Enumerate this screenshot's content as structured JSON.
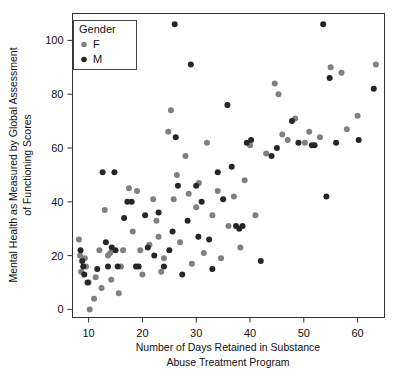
{
  "chart_data": {
    "type": "scatter",
    "title": "",
    "xlabel": "Number of Days Retained in Substance Abuse Treatment Program",
    "xlabel_line1": "Number of Days Retained in Substance",
    "xlabel_line2": "Abuse Treatment Program",
    "ylabel": "Mental Health as Measured by Global Assessment of Functioning Scores",
    "ylabel_line1": "Mental Health as Measured by Global Assessment",
    "ylabel_line2": "of Functioning Scores",
    "xlim": [
      7,
      65
    ],
    "ylim": [
      -3,
      110
    ],
    "xticks": [
      10,
      20,
      30,
      40,
      50,
      60
    ],
    "yticks": [
      0,
      20,
      40,
      60,
      80,
      100
    ],
    "xtick_labels": [
      "10",
      "20",
      "30",
      "40",
      "50",
      "60"
    ],
    "ytick_labels": [
      "0",
      "20",
      "40",
      "60",
      "80",
      "100"
    ],
    "grid": false,
    "legend": {
      "title": "Gender",
      "position": "top-left-inside",
      "entries": [
        {
          "name": "F",
          "label": "F",
          "color": "#808080"
        },
        {
          "name": "M",
          "label": "M",
          "color": "#262626"
        }
      ]
    },
    "marker": {
      "shape": "circle",
      "radius": 3.0
    },
    "series": [
      {
        "name": "F",
        "label": "F",
        "color": "#808080",
        "points": [
          [
            8.2,
            26
          ],
          [
            8.4,
            20
          ],
          [
            8.6,
            14
          ],
          [
            9.3,
            19
          ],
          [
            9.5,
            16
          ],
          [
            10.0,
            10
          ],
          [
            10.2,
            0
          ],
          [
            11.0,
            4
          ],
          [
            11.3,
            12
          ],
          [
            12.0,
            22
          ],
          [
            12.4,
            8
          ],
          [
            13.0,
            37
          ],
          [
            13.6,
            20
          ],
          [
            14.0,
            21
          ],
          [
            14.2,
            11
          ],
          [
            15.6,
            6
          ],
          [
            16.0,
            16
          ],
          [
            16.4,
            22
          ],
          [
            17.5,
            45
          ],
          [
            18.2,
            29
          ],
          [
            19.0,
            44
          ],
          [
            19.6,
            22
          ],
          [
            20.0,
            13
          ],
          [
            21.3,
            24
          ],
          [
            22.0,
            41
          ],
          [
            22.6,
            33
          ],
          [
            23.0,
            27
          ],
          [
            23.5,
            14
          ],
          [
            24.0,
            19
          ],
          [
            24.8,
            66
          ],
          [
            25.3,
            74
          ],
          [
            25.8,
            41
          ],
          [
            26.4,
            50
          ],
          [
            27.0,
            25
          ],
          [
            28.0,
            57
          ],
          [
            28.6,
            43
          ],
          [
            29.2,
            17
          ],
          [
            30.0,
            38
          ],
          [
            30.5,
            47
          ],
          [
            31.4,
            21
          ],
          [
            32.0,
            62
          ],
          [
            33.0,
            35
          ],
          [
            34.0,
            44
          ],
          [
            34.6,
            19
          ],
          [
            36.0,
            31
          ],
          [
            37.0,
            42
          ],
          [
            38.2,
            23
          ],
          [
            39.0,
            48
          ],
          [
            40.0,
            61
          ],
          [
            41.0,
            35
          ],
          [
            43.0,
            58
          ],
          [
            44.6,
            84
          ],
          [
            45.3,
            80
          ],
          [
            46.0,
            65
          ],
          [
            47.0,
            63
          ],
          [
            48.4,
            71
          ],
          [
            50.2,
            62
          ],
          [
            51.0,
            66
          ],
          [
            53.0,
            64
          ],
          [
            55.0,
            90
          ],
          [
            57.0,
            88
          ],
          [
            58.0,
            67
          ],
          [
            60.0,
            72
          ],
          [
            63.4,
            91
          ]
        ]
      },
      {
        "name": "M",
        "label": "M",
        "color": "#262626",
        "points": [
          [
            8.5,
            22
          ],
          [
            8.8,
            18
          ],
          [
            9.0,
            16
          ],
          [
            9.2,
            13
          ],
          [
            9.8,
            10
          ],
          [
            11.6,
            15
          ],
          [
            12.6,
            51
          ],
          [
            13.2,
            25
          ],
          [
            13.6,
            16
          ],
          [
            14.3,
            23
          ],
          [
            14.8,
            51
          ],
          [
            15.0,
            22
          ],
          [
            15.4,
            16
          ],
          [
            16.6,
            34
          ],
          [
            17.2,
            40
          ],
          [
            18.0,
            40
          ],
          [
            18.8,
            16
          ],
          [
            19.3,
            16
          ],
          [
            20.5,
            35
          ],
          [
            21.0,
            23
          ],
          [
            22.2,
            20
          ],
          [
            23.0,
            36
          ],
          [
            24.0,
            16
          ],
          [
            25.0,
            22
          ],
          [
            25.6,
            29
          ],
          [
            26.0,
            106
          ],
          [
            26.2,
            64
          ],
          [
            26.6,
            46
          ],
          [
            27.4,
            13
          ],
          [
            28.4,
            33
          ],
          [
            29.0,
            91
          ],
          [
            30.0,
            46
          ],
          [
            30.4,
            27
          ],
          [
            31.0,
            40
          ],
          [
            32.4,
            26
          ],
          [
            33.0,
            15
          ],
          [
            34.0,
            51
          ],
          [
            35.0,
            41
          ],
          [
            35.8,
            76
          ],
          [
            36.6,
            53
          ],
          [
            37.4,
            31
          ],
          [
            38.0,
            30
          ],
          [
            38.6,
            31
          ],
          [
            39.4,
            62
          ],
          [
            40.2,
            63
          ],
          [
            42.0,
            18
          ],
          [
            44.0,
            57
          ],
          [
            45.0,
            60
          ],
          [
            47.8,
            70
          ],
          [
            49.0,
            62
          ],
          [
            51.5,
            61
          ],
          [
            52.0,
            61
          ],
          [
            53.6,
            106
          ],
          [
            54.2,
            42
          ],
          [
            54.8,
            86
          ],
          [
            56.0,
            62
          ],
          [
            60.2,
            63
          ],
          [
            63.0,
            82
          ]
        ]
      }
    ]
  }
}
